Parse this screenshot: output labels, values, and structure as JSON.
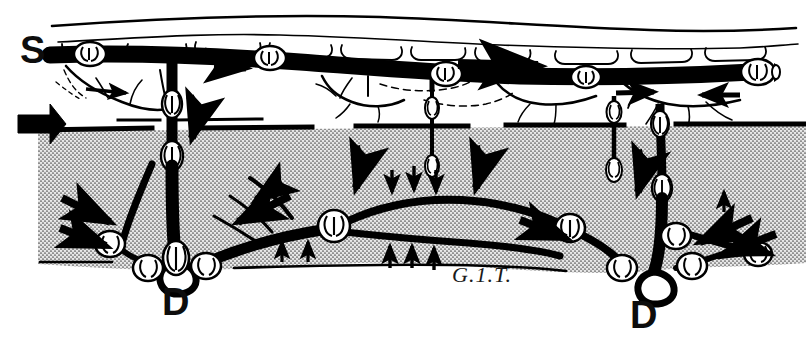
{
  "figure": {
    "medium": "black-and-white stipple line drawing",
    "background_color": "#ffffff",
    "ink_color": "#000000",
    "muscle_fill_color": "#d6d6d6",
    "width": 806,
    "height": 349
  },
  "labels": {
    "superficial": "S",
    "deep_left": "D",
    "deep_right": "D",
    "signature": "G.1.T."
  },
  "layers": [
    {
      "name": "skin-surface",
      "description": "outer skin contour line"
    },
    {
      "name": "subcutaneous-fat",
      "description": "white layer holding the superficial vein"
    },
    {
      "name": "deep-fascia",
      "description": "heavy horizontal boundary line"
    },
    {
      "name": "muscle-compartment",
      "description": "stippled grey mass containing the deep vein"
    }
  ],
  "vessels": [
    {
      "name": "superficial-vein",
      "label": "S",
      "depth": "superficial",
      "rendering": "solid black trunk"
    },
    {
      "name": "deep-vein",
      "label": "D",
      "depth": "deep",
      "rendering": "solid black trunk inside muscle"
    },
    {
      "name": "perforating-veins",
      "count": 4,
      "description": "valved channels crossing the deep fascia"
    },
    {
      "name": "tributary-veins",
      "description": "thin branching collaterals"
    }
  ],
  "valves": {
    "name": "bicuspid-venous-valve",
    "superficial_count": 5,
    "perforator_count": 8,
    "deep_count": 9,
    "description": "paired cusps drawn as white bulges on the vessel"
  },
  "arrows": [
    {
      "name": "inflow-arrow",
      "position": "left-margin",
      "direction": "right",
      "size": "large"
    },
    {
      "name": "superficial-flow-arrow",
      "position": "upper-left",
      "direction": "right",
      "size": "small"
    },
    {
      "name": "superficial-flow-arrow",
      "position": "upper-centre",
      "direction": "right",
      "size": "large"
    },
    {
      "name": "superficial-flow-arrow",
      "position": "upper-right-inner",
      "direction": "right",
      "size": "small"
    },
    {
      "name": "superficial-flow-arrow",
      "position": "upper-right-outer",
      "direction": "left",
      "size": "small"
    },
    {
      "name": "perforator-flow-arrow",
      "position": "left-perforator",
      "direction": "down",
      "size": "medium"
    },
    {
      "name": "perforator-flow-arrow",
      "position": "centre-perforator",
      "direction": "down",
      "size": "medium"
    },
    {
      "name": "perforator-flow-arrow",
      "position": "right-centre-perforator",
      "direction": "down",
      "size": "medium"
    },
    {
      "name": "perforator-flow-arrow",
      "position": "right-perforator",
      "direction": "down",
      "size": "medium"
    },
    {
      "name": "deep-flow-arrow",
      "position": "lower-left-outer",
      "direction": "down-right",
      "size": "medium"
    },
    {
      "name": "deep-flow-arrow",
      "position": "lower-left-centre",
      "direction": "down-left",
      "size": "medium"
    },
    {
      "name": "deep-flow-arrow",
      "position": "lower-centre",
      "direction": "down-right",
      "size": "medium"
    },
    {
      "name": "deep-flow-arrow",
      "position": "lower-right-outer",
      "direction": "down-left",
      "size": "medium"
    },
    {
      "name": "muscle-compression-arrow",
      "position": "above-deep-vein",
      "direction": "down",
      "count": 3,
      "size": "tiny"
    },
    {
      "name": "muscle-compression-arrow",
      "position": "below-deep-vein",
      "direction": "up",
      "count": 3,
      "size": "tiny"
    },
    {
      "name": "muscle-compression-arrow",
      "position": "left-lower-margin",
      "direction": "up",
      "count": 2,
      "size": "tiny"
    }
  ]
}
